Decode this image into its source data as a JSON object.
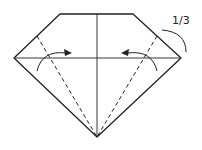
{
  "diagram": {
    "type": "origami-fold-step",
    "annotation_label": "1/3",
    "colors": {
      "line": "#222222",
      "background": "#ffffff"
    }
  }
}
